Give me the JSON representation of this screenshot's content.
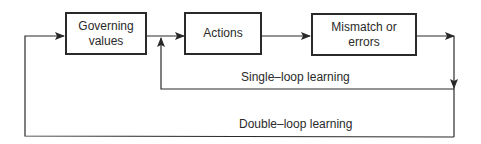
{
  "diagram": {
    "type": "flow",
    "nodes": [
      {
        "id": "governing",
        "lines": [
          "Governing",
          "values"
        ]
      },
      {
        "id": "actions",
        "lines": [
          "Actions"
        ]
      },
      {
        "id": "mismatch",
        "lines": [
          "Mismatch or",
          "errors"
        ]
      }
    ],
    "edges": [
      {
        "from": "governing",
        "to": "actions"
      },
      {
        "from": "actions",
        "to": "mismatch"
      },
      {
        "from": "mismatch",
        "to": "actions",
        "label": "Single–loop learning"
      },
      {
        "from": "mismatch",
        "to": "governing",
        "label": "Double–loop learning"
      }
    ],
    "labels": {
      "single_loop": "Single–loop learning",
      "double_loop": "Double–loop learning"
    }
  }
}
